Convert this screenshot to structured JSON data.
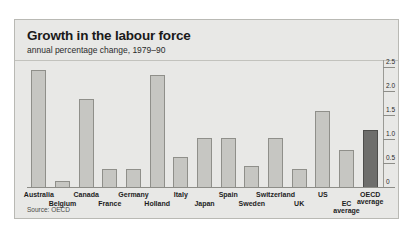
{
  "panel": {
    "title": "Growth in the labour force",
    "subtitle": "annual percentage change, 1979–90",
    "source": "Source: OECD"
  },
  "chart_data": {
    "type": "bar",
    "title": "Growth in the labour force",
    "subtitle": "annual percentage change, 1979–90",
    "xlabel": "",
    "ylabel": "",
    "ylim": [
      0,
      2.5
    ],
    "yticks": [
      "0",
      "0.5",
      "1.0",
      "1.5",
      "2.0",
      "2.5"
    ],
    "ytick_values": [
      0,
      0.5,
      1.0,
      1.5,
      2.0,
      2.5
    ],
    "axis_position": "right",
    "grid": false,
    "legend": "none",
    "source": "Source: OECD",
    "categories": [
      "Australia",
      "Belgium",
      "Canada",
      "France",
      "Germany",
      "Holland",
      "Italy",
      "Japan",
      "Spain",
      "Sweden",
      "Switzerland",
      "UK",
      "US",
      "EC average",
      "OECD average"
    ],
    "values": [
      2.45,
      0.15,
      1.85,
      0.4,
      0.4,
      2.35,
      0.65,
      1.05,
      1.05,
      0.45,
      1.05,
      0.4,
      1.6,
      0.8,
      1.2
    ],
    "highlight_category": "OECD average",
    "colors": {
      "bar": "#c6c6c2",
      "bar_border": "#8f8f8a",
      "bar_highlight": "#6e6e6c",
      "panel_background": "#e8e8e6",
      "panel_border": "#b9b9b4",
      "text": "#1a1a1a"
    }
  }
}
